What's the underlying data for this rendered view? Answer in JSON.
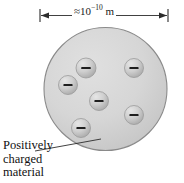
{
  "figure": {
    "dimension": {
      "approx_symbol": "≈",
      "mantissa": "10",
      "exponent": "−10",
      "unit": " m",
      "full_label": "≈10⁻¹⁰ m",
      "arrow_left_x": 40,
      "arrow_right_x": 168,
      "arrow_y": 15
    },
    "caption": {
      "line1": "Positively",
      "line2": "charged",
      "line3": "material"
    },
    "sphere": {
      "label": "positively-charged-sphere",
      "cx": 105.5,
      "cy": 89,
      "r": 61.5,
      "fill": "#d4d4d4",
      "stroke": "#8a8a8a"
    },
    "electrons": [
      {
        "name": "electron-1",
        "cx": 68,
        "cy": 85,
        "r": 9.5,
        "sign": "−"
      },
      {
        "name": "electron-2",
        "cx": 86,
        "cy": 68,
        "r": 10,
        "sign": "−"
      },
      {
        "name": "electron-3",
        "cx": 134,
        "cy": 68,
        "r": 9.5,
        "sign": "−"
      },
      {
        "name": "electron-4",
        "cx": 99,
        "cy": 101,
        "r": 9.5,
        "sign": "−"
      },
      {
        "name": "electron-5",
        "cx": 134,
        "cy": 115,
        "r": 9.5,
        "sign": "−"
      },
      {
        "name": "electron-6",
        "cx": 81,
        "cy": 128,
        "r": 9.5,
        "sign": "−"
      }
    ],
    "leader_line": {
      "name": "caption-leader-line",
      "x1": 35,
      "y1": 151,
      "x2": 101,
      "y2": 139
    },
    "colors": {
      "sphere_fill": "#d4d4d4",
      "sphere_stroke": "#8a8a8a",
      "electron_fill": "#c9c9c9",
      "electron_stroke": "#9a9a9a",
      "line": "#2b2b2b",
      "text": "#111111",
      "background": "#ffffff"
    }
  }
}
